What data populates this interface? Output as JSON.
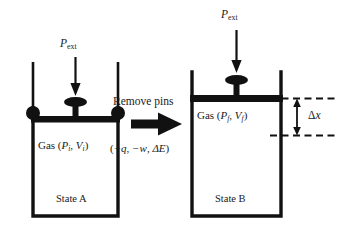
{
  "figure": {
    "background_color": "#ffffff",
    "ink_color": "#000000",
    "text_color": "#1a1a1a"
  },
  "left_panel": {
    "pressure_label": {
      "symbol": "P",
      "subscript": "ext"
    },
    "gas_label": {
      "prefix": "Gas (",
      "p_symbol": "P",
      "p_sub": "i",
      "sep": ", ",
      "v_symbol": "V",
      "v_sub": "i",
      "suffix": ")"
    },
    "state_label": "State A",
    "pins_present": true,
    "pin_count": 2
  },
  "right_panel": {
    "pressure_label": {
      "symbol": "P",
      "subscript": "ext"
    },
    "gas_label": {
      "prefix": "Gas (",
      "p_symbol": "P",
      "p_sub": "f",
      "sep": ", ",
      "v_symbol": "V",
      "v_sub": "f",
      "suffix": ")"
    },
    "state_label": "State B",
    "pins_present": false,
    "displacement_label": {
      "delta": "Δ",
      "variable": "x"
    }
  },
  "transition": {
    "operation_label": "Remove pins",
    "energy_label": {
      "q_term": "+q",
      "sep1": ", ",
      "w_term": "−w",
      "sep2": ", ",
      "e_term": "ΔE",
      "open": "(",
      "close": ")"
    },
    "arrow_direction": "right"
  }
}
